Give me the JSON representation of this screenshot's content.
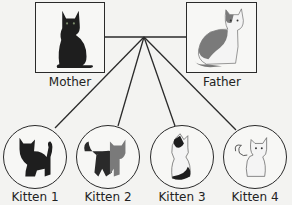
{
  "parents": [
    {
      "id": "mother",
      "label": "Mother",
      "cat_color": "black"
    },
    {
      "id": "father",
      "label": "Father",
      "cat_color": "gray-and-white"
    }
  ],
  "kittens": [
    {
      "id": "kitten-1",
      "label": "Kitten 1",
      "cat_color": "black"
    },
    {
      "id": "kitten-2",
      "label": "Kitten 2",
      "cat_color": "gray-and-black"
    },
    {
      "id": "kitten-3",
      "label": "Kitten 3",
      "cat_color": "white-with-black-patches"
    },
    {
      "id": "kitten-4",
      "label": "Kitten 4",
      "cat_color": "white"
    }
  ],
  "colors": {
    "line": "#2a2a2a",
    "black_cat": "#1e1e1e",
    "gray_cat": "#7a7a7a",
    "white_cat": "#f4f4f4",
    "background": "#f3f3f1"
  }
}
